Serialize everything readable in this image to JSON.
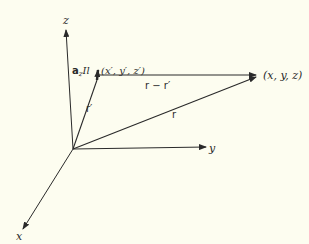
{
  "diagram": {
    "type": "vector geometry",
    "background": "#fdfdf0",
    "ink": "#2a2a2a",
    "axes": {
      "z": {
        "label": "z"
      },
      "y": {
        "label": "y"
      },
      "x": {
        "label": "x"
      }
    },
    "source_point": {
      "label": "(x′, y′, z′)"
    },
    "field_point": {
      "label": "(x, y, z)"
    },
    "current_element": {
      "unit_vector": "a",
      "subscript": "z",
      "label": "Il"
    },
    "vectors": {
      "r_prime": {
        "label": "r′"
      },
      "r": {
        "label": "r"
      },
      "r_minus_r_prime": {
        "label": "r − r′"
      }
    }
  }
}
